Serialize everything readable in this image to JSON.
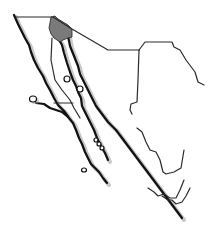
{
  "map": {
    "title": "",
    "region_description": "Northwestern Mexico (Baja California peninsula and Gulf of California coast)",
    "highlighted_region": {
      "name": "Mexicali area (northeast Baja California)",
      "fill": "#7a7a7a"
    },
    "colors": {
      "background": "#ffffff",
      "coastline": "#111111",
      "borders": "#2a2a2a",
      "shadow": "#9a9a9a"
    },
    "labels": []
  }
}
